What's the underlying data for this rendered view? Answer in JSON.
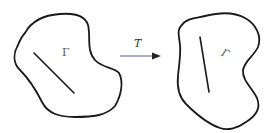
{
  "diagram": {
    "type": "transformation-illustration",
    "left_region": {
      "label": "Γ",
      "label_style": "upright",
      "contains": "straight line segment (diagonal)"
    },
    "transform": {
      "label": "T",
      "arrow_direction": "right",
      "arrow_color": "#5a5a9a"
    },
    "right_region": {
      "label": "Γ",
      "label_style": "rotated/skewed",
      "contains": "straight line segment (near-vertical)"
    },
    "stroke_color": "#1a1a1a",
    "label_color": "#555555"
  }
}
